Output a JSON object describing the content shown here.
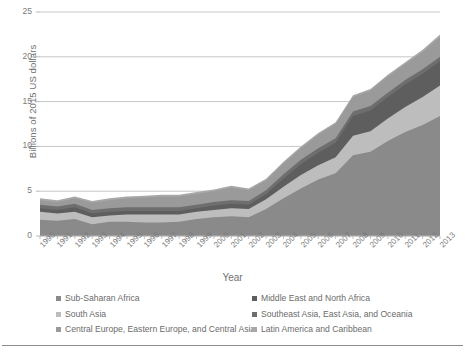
{
  "axes": {
    "ylabel": "Billions of 2015 US dollars",
    "xlabel": "Year",
    "yticks": [
      "0",
      "5",
      "10",
      "15",
      "20",
      "25"
    ]
  },
  "legend": {
    "rows": [
      [
        {
          "label": "Sub-Saharan Africa",
          "color": "#8a8a8a"
        },
        {
          "label": "Middle East and North Africa",
          "color": "#5e5e5e"
        }
      ],
      [
        {
          "label": "South Asia",
          "color": "#bdbdbd"
        },
        {
          "label": "Southeast Asia, East Asia, and Oceania",
          "color": "#6e6e6e"
        }
      ],
      [
        {
          "label": "Central Europe, Eastern Europe, and Central Asia",
          "color": "#9a9a9a"
        },
        {
          "label": "Latin America and Caribbean",
          "color": "#a8a8a8"
        }
      ]
    ]
  },
  "chart_data": {
    "type": "area",
    "stacked": true,
    "title": "",
    "xlabel": "Year",
    "ylabel": "Billions of 2015 US dollars",
    "ylim": [
      0,
      25
    ],
    "yticks": [
      0,
      5,
      10,
      15,
      20,
      25
    ],
    "grid": "horizontal",
    "legend_position": "bottom",
    "categories": [
      "1990",
      "1991",
      "1992",
      "1993",
      "1994",
      "1995",
      "1996",
      "1997",
      "1998",
      "1999",
      "2000",
      "2001",
      "2002",
      "2003",
      "2004",
      "2005",
      "2006",
      "2007",
      "2008",
      "2009",
      "2010",
      "2011",
      "2012",
      "2013"
    ],
    "series": [
      {
        "name": "Sub-Saharan Africa",
        "color": "#8a8a8a",
        "values": [
          1.8,
          1.7,
          1.9,
          1.3,
          1.6,
          1.6,
          1.5,
          1.5,
          1.6,
          1.9,
          2.1,
          2.2,
          2.1,
          3.0,
          4.2,
          5.3,
          6.3,
          7.0,
          9.0,
          9.4,
          10.6,
          11.6,
          12.4,
          13.4
        ]
      },
      {
        "name": "South Asia",
        "color": "#bdbdbd",
        "values": [
          0.9,
          0.8,
          0.8,
          0.8,
          0.7,
          0.8,
          0.9,
          0.9,
          0.8,
          0.8,
          0.8,
          0.9,
          0.9,
          1.1,
          1.3,
          1.5,
          1.6,
          1.8,
          2.2,
          2.3,
          2.5,
          2.8,
          3.1,
          3.4
        ]
      },
      {
        "name": "Middle East and North Africa",
        "color": "#5e5e5e",
        "values": [
          0.4,
          0.4,
          0.5,
          0.4,
          0.4,
          0.4,
          0.4,
          0.4,
          0.4,
          0.4,
          0.5,
          0.5,
          0.5,
          0.6,
          0.9,
          1.2,
          1.4,
          1.6,
          2.2,
          2.3,
          2.4,
          2.5,
          2.6,
          2.7
        ]
      },
      {
        "name": "Southeast Asia, East Asia, and Oceania",
        "color": "#6e6e6e",
        "values": [
          0.4,
          0.4,
          0.4,
          0.4,
          0.4,
          0.4,
          0.4,
          0.4,
          0.4,
          0.4,
          0.4,
          0.4,
          0.4,
          0.4,
          0.5,
          0.5,
          0.5,
          0.5,
          0.5,
          0.5,
          0.5,
          0.5,
          0.5,
          0.5
        ]
      },
      {
        "name": "Central Europe, Eastern Europe, and Central Asia",
        "color": "#9a9a9a",
        "values": [
          0.5,
          0.5,
          0.6,
          0.8,
          0.9,
          1.0,
          1.1,
          1.2,
          1.2,
          1.2,
          1.2,
          1.4,
          1.2,
          1.1,
          1.2,
          1.3,
          1.5,
          1.6,
          1.6,
          1.7,
          1.8,
          1.8,
          1.9,
          2.2
        ]
      },
      {
        "name": "Latin America and Caribbean",
        "color": "#a8a8a8",
        "values": [
          0.2,
          0.2,
          0.2,
          0.2,
          0.2,
          0.2,
          0.2,
          0.2,
          0.2,
          0.2,
          0.2,
          0.2,
          0.2,
          0.2,
          0.2,
          0.2,
          0.2,
          0.2,
          0.2,
          0.2,
          0.2,
          0.2,
          0.3,
          0.3
        ]
      }
    ]
  }
}
